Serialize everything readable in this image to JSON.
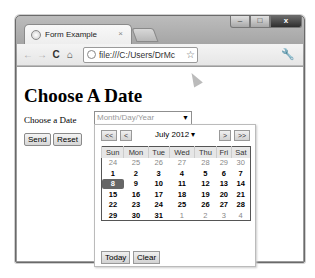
{
  "window": {
    "controls": {
      "minimize": "–",
      "maximize": "□",
      "close": "x"
    }
  },
  "tab": {
    "title": "Form Example",
    "close": "×",
    "icon": "globe-icon"
  },
  "toolbar": {
    "back": "←",
    "forward": "→",
    "reload": "C",
    "home": "⌂",
    "url": "file:///C:/Users/DrMc",
    "star": "☆",
    "wrench": "🔧"
  },
  "page": {
    "heading": "Choose A Date",
    "label": "Choose a Date",
    "date_placeholder": "Month/Day/Year",
    "dropdown_arrow": "▼",
    "send": "Send",
    "reset": "Reset"
  },
  "datepicker": {
    "prev_year": "<<",
    "prev_month": "<",
    "next_month": ">",
    "next_year": ">>",
    "month_year": "July 2012 ▾",
    "weekdays": [
      "Sun",
      "Mon",
      "Tue",
      "Wed",
      "Thu",
      "Fri",
      "Sat"
    ],
    "weeks": [
      [
        {
          "d": "24",
          "o": true
        },
        {
          "d": "25",
          "o": true
        },
        {
          "d": "26",
          "o": true
        },
        {
          "d": "27",
          "o": true
        },
        {
          "d": "28",
          "o": true
        },
        {
          "d": "29",
          "o": true
        },
        {
          "d": "30",
          "o": true
        }
      ],
      [
        {
          "d": "1"
        },
        {
          "d": "2"
        },
        {
          "d": "3"
        },
        {
          "d": "4"
        },
        {
          "d": "5"
        },
        {
          "d": "6"
        },
        {
          "d": "7"
        }
      ],
      [
        {
          "d": "8",
          "s": true
        },
        {
          "d": "9"
        },
        {
          "d": "10"
        },
        {
          "d": "11"
        },
        {
          "d": "12"
        },
        {
          "d": "13"
        },
        {
          "d": "14"
        }
      ],
      [
        {
          "d": "15"
        },
        {
          "d": "16"
        },
        {
          "d": "17"
        },
        {
          "d": "18"
        },
        {
          "d": "19"
        },
        {
          "d": "20"
        },
        {
          "d": "21"
        }
      ],
      [
        {
          "d": "22"
        },
        {
          "d": "23"
        },
        {
          "d": "24"
        },
        {
          "d": "25"
        },
        {
          "d": "26"
        },
        {
          "d": "27"
        },
        {
          "d": "28"
        }
      ],
      [
        {
          "d": "29"
        },
        {
          "d": "30"
        },
        {
          "d": "31"
        },
        {
          "d": "1",
          "o": true
        },
        {
          "d": "2",
          "o": true
        },
        {
          "d": "3",
          "o": true
        },
        {
          "d": "4",
          "o": true
        }
      ]
    ],
    "today": "Today",
    "clear": "Clear"
  }
}
